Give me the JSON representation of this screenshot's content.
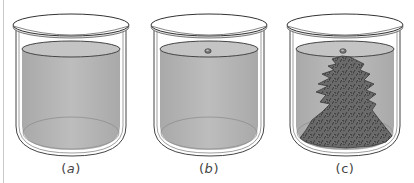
{
  "figure": {
    "panels": [
      {
        "id": "a",
        "caption": "(a)",
        "caption_letter": "a",
        "italic": true,
        "has_seed_crystal": false,
        "has_crystal_growth": false
      },
      {
        "id": "b",
        "caption": "(b)",
        "caption_letter": "b",
        "italic": true,
        "has_seed_crystal": true,
        "has_crystal_growth": false
      },
      {
        "id": "c",
        "caption": "(c)",
        "caption_letter": "c",
        "italic": false,
        "has_seed_crystal": true,
        "has_crystal_growth": true
      }
    ],
    "colors": {
      "liquid": "#b9b9b9",
      "liquid_top": "#c7c7c7",
      "glass_outline": "#333333",
      "lid_fill": "#ffffff",
      "crystal": "#555555",
      "frame_line": "#c9c9c9"
    }
  },
  "labels": {
    "a_open": "(",
    "a_letter": "a",
    "a_close": ")",
    "b_open": "(",
    "b_letter": "b",
    "b_close": ")",
    "c_text": "(c)"
  }
}
